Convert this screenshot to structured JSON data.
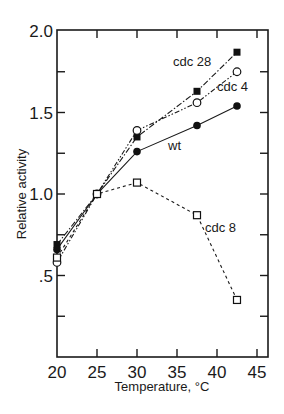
{
  "chart_data": {
    "type": "line",
    "title": "",
    "xlabel": "Temperature, °C",
    "ylabel": "Relative activity",
    "xlim": [
      20,
      46.4
    ],
    "ylim": [
      0,
      2.0
    ],
    "x_ticks": [
      20,
      25,
      30,
      35,
      40,
      45
    ],
    "x_tick_labels": [
      "20",
      "25",
      "30",
      "35",
      "40",
      "45"
    ],
    "y_ticks": [
      0.25,
      0.5,
      0.75,
      1.0,
      1.25,
      1.5,
      1.75,
      2.0
    ],
    "y_tick_labels": [
      {
        "value": 0.5,
        "label": ".5"
      },
      {
        "value": 1.0,
        "label": "1.0"
      },
      {
        "value": 1.5,
        "label": "1.5"
      },
      {
        "value": 2.0,
        "label": "2.0"
      }
    ],
    "grid": false,
    "legend": "inline labels",
    "series": [
      {
        "name": "cdc 28",
        "marker": "filled-square",
        "line": "dash-dot",
        "x": [
          20,
          25,
          30,
          37.5,
          42.5
        ],
        "values": [
          0.69,
          1.0,
          1.35,
          1.63,
          1.87
        ],
        "label_pos": {
          "x": 173,
          "y": 66
        }
      },
      {
        "name": "cdc 4",
        "marker": "open-circle",
        "line": "dash-dot-dot",
        "x": [
          20,
          25,
          30,
          37.5,
          42.5
        ],
        "values": [
          0.58,
          1.0,
          1.39,
          1.56,
          1.75
        ],
        "label_pos": {
          "x": 217,
          "y": 91
        }
      },
      {
        "name": "wt",
        "marker": "filled-circle",
        "line": "solid",
        "x": [
          20,
          25,
          30,
          37.5,
          42.5
        ],
        "values": [
          0.66,
          1.0,
          1.26,
          1.42,
          1.54
        ],
        "label_pos": {
          "x": 168,
          "y": 150
        }
      },
      {
        "name": "cdc 8",
        "marker": "open-square",
        "line": "dashed",
        "x": [
          20,
          25,
          30,
          37.5,
          42.5
        ],
        "values": [
          0.61,
          1.0,
          1.07,
          0.87,
          0.35
        ],
        "label_pos": {
          "x": 205,
          "y": 232
        }
      }
    ]
  }
}
